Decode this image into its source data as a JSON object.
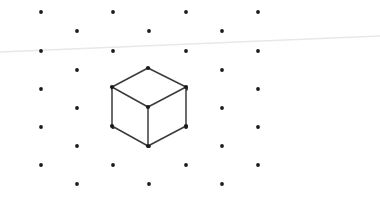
{
  "canvas": {
    "width": 380,
    "height": 205,
    "background_color": "#ffffff",
    "description": "isometric wireframe cube on staggered dot lattice"
  },
  "colors": {
    "background": "#ffffff",
    "dot": "#1a1a1a",
    "cube_edge": "#3b3b3b",
    "cube_vertex": "#1a1a1a",
    "cube_face": "#ffffff",
    "horizon_line": "#e8e8ea"
  },
  "dot_lattice": {
    "name": "staggered-dot-grid",
    "dot_radius": 1.9,
    "rows": [
      {
        "y": 12,
        "type": "primary",
        "xs": [
          41,
          113,
          186,
          258
        ]
      },
      {
        "y": 31,
        "type": "offset",
        "xs": [
          77,
          149,
          222
        ]
      },
      {
        "y": 51,
        "type": "primary",
        "xs": [
          41,
          113,
          186,
          258
        ]
      },
      {
        "y": 70,
        "type": "offset",
        "xs": [
          77,
          149,
          222
        ]
      },
      {
        "y": 89,
        "type": "primary",
        "xs": [
          41,
          113,
          186,
          258
        ]
      },
      {
        "y": 108,
        "type": "offset",
        "xs": [
          77,
          149,
          222
        ]
      },
      {
        "y": 127,
        "type": "primary",
        "xs": [
          41,
          113,
          186,
          258
        ]
      },
      {
        "y": 146,
        "type": "offset",
        "xs": [
          77,
          149,
          222
        ]
      },
      {
        "y": 165,
        "type": "primary",
        "xs": [
          41,
          113,
          186,
          258
        ]
      },
      {
        "y": 184,
        "type": "offset",
        "xs": [
          77,
          149,
          222
        ]
      }
    ]
  },
  "horizon_line": {
    "name": "faint-horizon-line",
    "x1": 0,
    "y1": 52,
    "x2": 380,
    "y2": 36,
    "stroke_width": 1.4
  },
  "cube": {
    "name": "isometric-wireframe-cube",
    "edge_stroke_width": 1.5,
    "vertex_radius": 2.1,
    "vertices": {
      "top": {
        "x": 148,
        "y": 68
      },
      "left_top": {
        "x": 112,
        "y": 87
      },
      "right_top": {
        "x": 186,
        "y": 87
      },
      "center": {
        "x": 148,
        "y": 107
      },
      "left_bottom": {
        "x": 112,
        "y": 126
      },
      "right_bottom": {
        "x": 186,
        "y": 126
      },
      "bottom": {
        "x": 148,
        "y": 146
      }
    },
    "faces": {
      "top_face": "148,68 186,87 148,107 112,87",
      "left_face": "112,87 148,107 148,146 112,126",
      "right_face": "148,107 186,87 186,126 148,146"
    },
    "edges": [
      {
        "name": "top-to-left-top",
        "x1": 148,
        "y1": 68,
        "x2": 112,
        "y2": 87
      },
      {
        "name": "top-to-right-top",
        "x1": 148,
        "y1": 68,
        "x2": 186,
        "y2": 87
      },
      {
        "name": "left-top-to-center",
        "x1": 112,
        "y1": 87,
        "x2": 148,
        "y2": 107
      },
      {
        "name": "right-top-to-center",
        "x1": 186,
        "y1": 87,
        "x2": 148,
        "y2": 107
      },
      {
        "name": "left-top-to-left-bottom",
        "x1": 112,
        "y1": 87,
        "x2": 112,
        "y2": 126
      },
      {
        "name": "right-top-to-right-bottom",
        "x1": 186,
        "y1": 87,
        "x2": 186,
        "y2": 126
      },
      {
        "name": "center-to-bottom",
        "x1": 148,
        "y1": 107,
        "x2": 148,
        "y2": 146
      },
      {
        "name": "left-bottom-to-bottom",
        "x1": 112,
        "y1": 126,
        "x2": 148,
        "y2": 146
      },
      {
        "name": "right-bottom-to-bottom",
        "x1": 186,
        "y1": 126,
        "x2": 148,
        "y2": 146
      }
    ],
    "vertex_points": [
      {
        "name": "vertex-top",
        "x": 148,
        "y": 68
      },
      {
        "name": "vertex-left-top",
        "x": 112,
        "y": 87
      },
      {
        "name": "vertex-right-top",
        "x": 186,
        "y": 87
      },
      {
        "name": "vertex-center",
        "x": 148,
        "y": 107
      },
      {
        "name": "vertex-left-bottom",
        "x": 112,
        "y": 126
      },
      {
        "name": "vertex-right-bottom",
        "x": 186,
        "y": 126
      },
      {
        "name": "vertex-bottom",
        "x": 148,
        "y": 146
      }
    ]
  }
}
